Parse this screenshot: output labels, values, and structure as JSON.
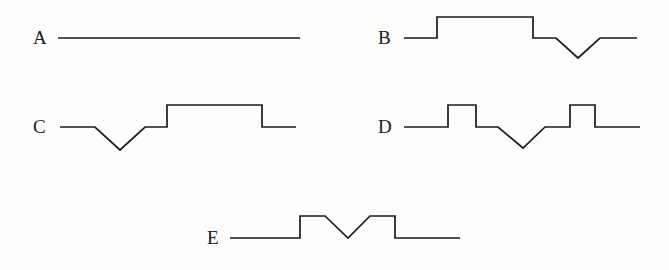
{
  "figure": {
    "title": "",
    "background_color": "#fdfdfc",
    "line_color": "#1b1b1b",
    "label_color": "#1a1a1a",
    "panel_count": 5
  },
  "panels": [
    {
      "id": "A",
      "label": "A",
      "label_x": 33,
      "label_y": 44,
      "description": "flat constant baseline",
      "points": "58,38 300,38"
    },
    {
      "id": "B",
      "label": "B",
      "label_x": 378,
      "label_y": 44,
      "description": "baseline, wide raised plateau, baseline, V dip, baseline",
      "points": "404,38 437,38 437,17 533,17 533,38 556,38 578,58 600,38 637,38"
    },
    {
      "id": "C",
      "label": "C",
      "label_x": 33,
      "label_y": 133,
      "description": "baseline, V dip, baseline, wide raised plateau, baseline",
      "points": "60,127 95,127 120,150 145,127 167,127 167,105 262,105 262,127 296,127"
    },
    {
      "id": "D",
      "label": "D",
      "label_x": 378,
      "label_y": 133,
      "description": "baseline, narrow square pulse, baseline, V dip, baseline, narrow square pulse, baseline",
      "points": "404,127 448,127 448,105 476,105 476,127 498,127 523,148 545,127 570,127 570,105 595,105 595,127 640,127"
    },
    {
      "id": "E",
      "label": "E",
      "label_x": 207,
      "label_y": 244,
      "description": "baseline, raised plateau with central V notch, baseline",
      "points": "230,238 300,238 300,216 325,216 348,238 370,216 395,216 395,238 460,238"
    }
  ],
  "chart_data": {
    "type": "line",
    "title": "",
    "xlabel": "",
    "ylabel": "",
    "grid": false,
    "legend": "none",
    "series": [
      {
        "name": "A",
        "x": [
          0,
          1
        ],
        "values": [
          0,
          0
        ]
      },
      {
        "name": "B",
        "x": [
          0,
          0.14,
          0.14,
          0.55,
          0.55,
          0.65,
          0.75,
          0.84,
          1
        ],
        "values": [
          0,
          0,
          1,
          1,
          0,
          0,
          -0.95,
          0,
          0
        ]
      },
      {
        "name": "C",
        "x": [
          0,
          0.15,
          0.25,
          0.36,
          0.45,
          0.45,
          0.86,
          0.86,
          1
        ],
        "values": [
          0,
          0,
          -1,
          0,
          0,
          1,
          1,
          0,
          0
        ]
      },
      {
        "name": "D",
        "x": [
          0,
          0.19,
          0.19,
          0.31,
          0.31,
          0.4,
          0.5,
          0.6,
          0.7,
          0.7,
          0.81,
          0.81,
          1
        ],
        "values": [
          0,
          0,
          1,
          1,
          0,
          0,
          -0.95,
          0,
          0,
          1,
          1,
          0,
          0
        ]
      },
      {
        "name": "E",
        "x": [
          0,
          0.3,
          0.3,
          0.41,
          0.51,
          0.61,
          0.72,
          0.72,
          1
        ],
        "values": [
          0,
          0,
          1,
          1,
          0,
          1,
          1,
          0,
          0
        ]
      }
    ]
  }
}
